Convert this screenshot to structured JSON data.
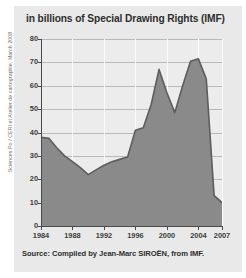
{
  "credit": "Sciences Po / CERI et Atelier de cartographie, March 2008",
  "source": "Source: Compiled by Jean-Marc SIROËN, from IMF.",
  "chart_data": {
    "type": "area",
    "title": "in billions of Special Drawing Rights (IMF)",
    "xlabel": "",
    "ylabel": "",
    "xlim": [
      1984,
      2007
    ],
    "ylim": [
      0,
      80
    ],
    "grid": true,
    "legend": false,
    "fill_color": "#8a8a8a",
    "line_color": "#5d5d5d",
    "plot_bg": "#ececec",
    "panel_bg": "#e9e9e9",
    "yticks": [
      0,
      10,
      20,
      30,
      40,
      50,
      60,
      70,
      80
    ],
    "ytick_labels": [
      "0",
      "10",
      "20",
      "30",
      "40",
      "50",
      "60",
      "70",
      "80"
    ],
    "xticks": [
      1984,
      1988,
      1992,
      1996,
      2000,
      2004,
      2007
    ],
    "xtick_labels": [
      "1984",
      "1988",
      "1992",
      "1996",
      "2000",
      "2004",
      "2007"
    ],
    "x": [
      1984,
      1985,
      1986,
      1987,
      1988,
      1989,
      1990,
      1991,
      1992,
      1993,
      1994,
      1995,
      1996,
      1997,
      1998,
      1999,
      2000,
      2001,
      2002,
      2003,
      2004,
      2005,
      2006,
      2007
    ],
    "values": [
      38,
      37.5,
      33.5,
      30,
      27.5,
      25,
      22,
      24,
      26,
      27.5,
      28.5,
      29.5,
      41,
      42,
      52,
      67,
      57,
      48.5,
      60,
      70.5,
      71.5,
      63,
      13,
      10
    ],
    "series": [
      {
        "name": "IMF credit outstanding",
        "values": [
          38,
          37.5,
          33.5,
          30,
          27.5,
          25,
          22,
          24,
          26,
          27.5,
          28.5,
          29.5,
          41,
          42,
          52,
          67,
          57,
          48.5,
          60,
          70.5,
          71.5,
          63,
          13,
          10
        ]
      }
    ]
  }
}
